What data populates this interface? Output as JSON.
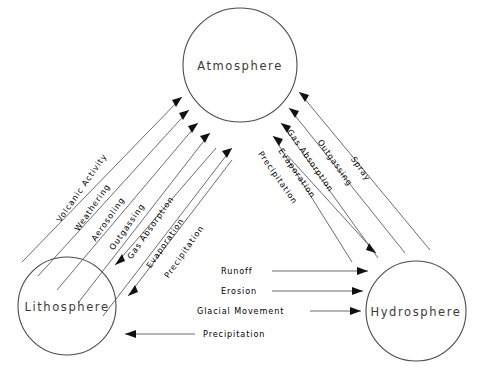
{
  "diagram": {
    "background_color": "#ffffff",
    "line_color": "#5b5b5b",
    "text_color": "#2e2e2e",
    "spheres": [
      {
        "id": "atmosphere",
        "label": "Atmosphere",
        "cx": 240,
        "cy": 65,
        "r": 57
      },
      {
        "id": "lithosphere",
        "label": "Lithosphere",
        "cx": 67,
        "cy": 306,
        "r": 49
      },
      {
        "id": "hydrosphere",
        "label": "Hydrosphere",
        "cx": 416,
        "cy": 311,
        "r": 50
      }
    ],
    "flows_lithosphere_atmosphere": [
      {
        "label": "Volcanic Activity",
        "direction": "to-atmosphere"
      },
      {
        "label": "Weathering",
        "direction": "to-atmosphere"
      },
      {
        "label": "Aerosoling",
        "direction": "to-atmosphere"
      },
      {
        "label": "Outgassing",
        "direction": "to-atmosphere"
      },
      {
        "label": "Gas Absorption",
        "direction": "to-atmosphere"
      },
      {
        "label": "Evaporation",
        "direction": "to-lithosphere"
      },
      {
        "label": "Precipitation",
        "direction": "to-lithosphere"
      }
    ],
    "flows_hydrosphere_atmosphere": [
      {
        "label": "Spray",
        "direction": "to-atmosphere"
      },
      {
        "label": "Outgassing",
        "direction": "to-atmosphere"
      },
      {
        "label": "Gas Absorption",
        "direction": "to-atmosphere"
      },
      {
        "label": "Evaporation",
        "direction": "to-atmosphere"
      },
      {
        "label": "Precipitation",
        "direction": "to-hydrosphere"
      }
    ],
    "flows_lithosphere_hydrosphere": [
      {
        "label": "Runoff",
        "direction": "to-hydrosphere"
      },
      {
        "label": "Erosion",
        "direction": "to-hydrosphere"
      },
      {
        "label": "Glacial Movement",
        "direction": "to-hydrosphere"
      },
      {
        "label": "Precipitation",
        "direction": "to-lithosphere"
      }
    ]
  }
}
